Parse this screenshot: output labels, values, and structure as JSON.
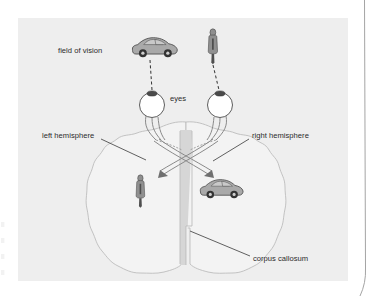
{
  "figure": {
    "labels": {
      "field_of_vision": "field of vision",
      "eyes": "eyes",
      "left_hemisphere": "left hemisphere",
      "right_hemisphere": "right hemisphere",
      "corpus_callosum": "corpus callosum"
    },
    "objects": {
      "outer_car": "car-icon",
      "outer_person": "person-icon",
      "inner_person": "person-icon",
      "inner_car": "car-icon",
      "left_eye": "eye-icon",
      "right_eye": "eye-icon"
    },
    "colors": {
      "panel_background": "#eeeeee",
      "page_background": "#ffffff",
      "brain_fill": "#f3f3f3",
      "brain_outline": "#b9b9b9",
      "corpus_callosum_fill": "#d6d6d6",
      "label_text": "#2b2b2b",
      "leader_line": "#444444",
      "sight_line": "#3a3a3a",
      "car_body": "#a9a9a9",
      "person_coat": "#909090"
    }
  }
}
